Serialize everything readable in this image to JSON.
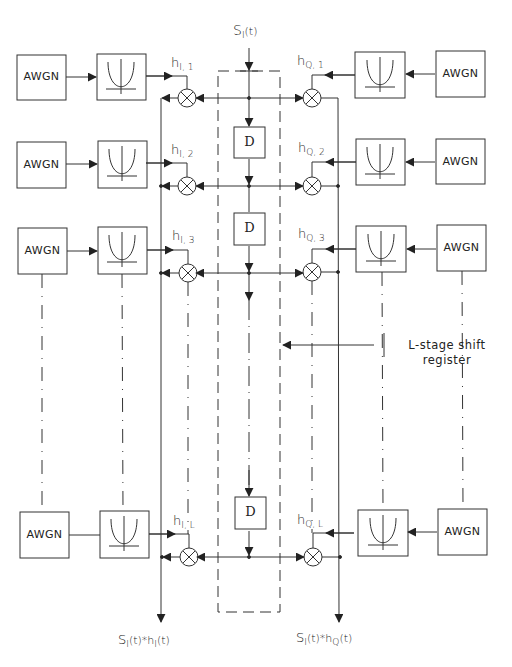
{
  "diagram": {
    "input_signal": {
      "base": "S",
      "sub": "I",
      "suffix": "(t)"
    },
    "noise_block_label": "AWGN",
    "delay_block_label": "D",
    "shift_register_label": {
      "line1": "L-stage shift",
      "line2": "register"
    },
    "left_branch": {
      "taps": [
        {
          "base": "h",
          "sub": "I, 1"
        },
        {
          "base": "h",
          "sub": "I, 2"
        },
        {
          "base": "h",
          "sub": "I, 3"
        },
        {
          "base": "h",
          "sub": "I, L"
        }
      ],
      "output": {
        "base": "S",
        "sub": "I",
        "mid": "(t)*h",
        "sub2": "I",
        "suffix": "(t)"
      }
    },
    "right_branch": {
      "taps": [
        {
          "base": "h",
          "sub": "Q, 1"
        },
        {
          "base": "h",
          "sub": "Q, 2"
        },
        {
          "base": "h",
          "sub": "Q, 3"
        },
        {
          "base": "h",
          "sub": "Q, L"
        }
      ],
      "output": {
        "base": "S",
        "sub": "I",
        "mid": "(t)*h",
        "sub2": "Q",
        "suffix": "(t)"
      }
    },
    "colors": {
      "line": "#333333",
      "background": "#ffffff"
    }
  }
}
